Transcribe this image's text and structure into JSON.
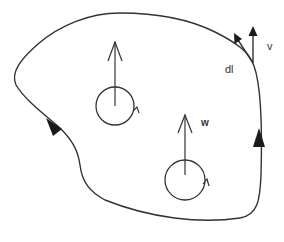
{
  "diagram": {
    "stroke_color": "#333333",
    "background": "#ffffff",
    "labels": {
      "velocity": "v",
      "line_element": "dl",
      "vorticity": "w"
    },
    "contour": {
      "direction_arrows": [
        {
          "position": "left-lower",
          "direction": "down-right"
        },
        {
          "position": "right-middle",
          "direction": "up"
        }
      ]
    },
    "vortices": [
      {
        "id": "upper-left",
        "cx": 115,
        "cy": 106,
        "r": 19,
        "arrow_top_y": 44,
        "rotation": "counter-clockwise"
      },
      {
        "id": "lower-right",
        "cx": 185,
        "cy": 180,
        "r": 19,
        "arrow_top_y": 117,
        "rotation": "counter-clockwise"
      }
    ],
    "tangent_point": {
      "x": 253,
      "y": 63
    }
  }
}
